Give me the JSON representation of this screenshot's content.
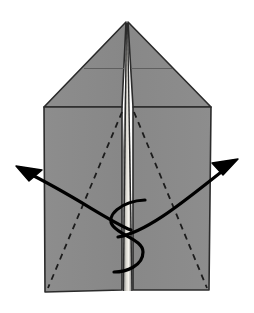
{
  "figure": {
    "canvas": {
      "width": 254,
      "height": 313
    },
    "colors": {
      "background": "#ffffff",
      "paper_fill": "#8a8a8a",
      "paper_fill_shadow": "#7e7e7e",
      "paper_fill_highlight": "#f2f0ea",
      "outline": "#2b2b2b",
      "crease_solid": "#3a3a3a",
      "crease_dashed": "#1c1c1c",
      "arrow": "#000000"
    },
    "shapes": {
      "left_panel": {
        "name": "left-paper-panel",
        "points": "44,107 122,107 122,290 45,292"
      },
      "right_panel": {
        "name": "right-paper-panel",
        "points": "133,107 211,107 209,290 133,290"
      },
      "left_nose_triangle": {
        "name": "left-nose-triangle",
        "points": "126,22 44,107 122,107"
      },
      "right_nose_triangle": {
        "name": "right-nose-triangle",
        "points": "128,22 211,107 133,107"
      },
      "center_spine": {
        "name": "center-spine-sliver",
        "points": "127,22 131,150 132,290 124,290 123,150"
      }
    },
    "creases": {
      "nose_horizontal_left": {
        "name": "nose-crease-left",
        "x1": 84,
        "y1": 68,
        "x2": 124,
        "y2": 68
      },
      "nose_horizontal_right": {
        "name": "nose-crease-right",
        "x1": 131,
        "y1": 68,
        "x2": 172,
        "y2": 68
      },
      "spine_left": {
        "name": "spine-edge-left",
        "x1": 126,
        "y1": 23,
        "x2": 123,
        "y2": 290
      },
      "spine_right": {
        "name": "spine-edge-right",
        "x1": 128,
        "y1": 23,
        "x2": 132,
        "y2": 290
      }
    },
    "dashed_folds": [
      {
        "name": "dashed-fold-left",
        "x1": 122,
        "y1": 112,
        "x2": 48,
        "y2": 288,
        "dash": "6 5"
      },
      {
        "name": "dashed-fold-right",
        "x1": 134,
        "y1": 112,
        "x2": 207,
        "y2": 288,
        "dash": "6 5"
      }
    ],
    "arrows": [
      {
        "name": "fold-arrow-left",
        "direction": "upper-left",
        "path": "M 131 230 C 110 222 75 196 26 172",
        "head": "17,166 40,170 30,180"
      },
      {
        "name": "fold-arrow-right",
        "direction": "upper-right",
        "path": "M 118 237 C 150 232 195 192 229 166",
        "head": "237,160 215,163 224,174"
      }
    ],
    "s_curve": {
      "name": "tuck-s-curve",
      "path": "M 145 200 C 121 201 105 216 113 226 C 121 236 143 240 143 252 C 143 266 126 272 114 272"
    }
  }
}
